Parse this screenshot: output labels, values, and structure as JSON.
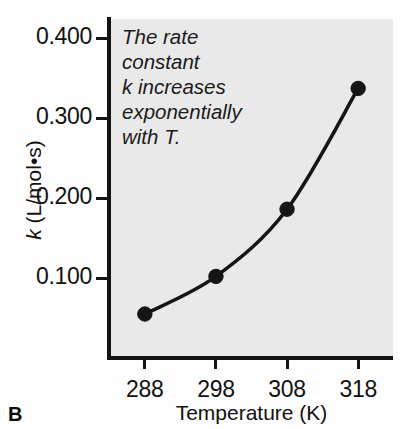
{
  "panel": {
    "label": "B"
  },
  "annotation": {
    "lines": [
      "The rate",
      "constant",
      "k increases",
      "exponentially",
      "with T."
    ],
    "full_text": "The rate constant k increases exponentially with T."
  },
  "axes": {
    "y_title_symbol": "k",
    "y_title_units": " (L/mol•s)",
    "x_title": "Temperature (K)"
  },
  "colors": {
    "plot_background": "#e9e9e9",
    "page_background": "#fdfdfd",
    "ink": "#151515",
    "curve": "#151515",
    "marker": "#151515"
  },
  "chart_data": {
    "type": "line",
    "title": "",
    "subtitle": "",
    "xlabel": "Temperature (K)",
    "ylabel": "k (L/mol•s)",
    "x": [
      288,
      298,
      308,
      318
    ],
    "values": [
      0.055,
      0.102,
      0.186,
      0.337
    ],
    "series": [
      {
        "name": "k",
        "values": [
          0.055,
          0.102,
          0.186,
          0.337
        ]
      }
    ],
    "xtick_labels": [
      "288",
      "298",
      "308",
      "318"
    ],
    "ytick_labels": [
      "0.100",
      "0.200",
      "0.300",
      "0.400"
    ],
    "xticks": [
      288,
      298,
      308,
      318
    ],
    "yticks": [
      0.1,
      0.2,
      0.3,
      0.4
    ],
    "xlim": [
      283.1,
      322.9
    ],
    "ylim": [
      0.0,
      0.4238
    ],
    "grid": false,
    "legend": false,
    "legend_position": "none",
    "markers": "filled-circle",
    "annotations": [
      "The rate constant k increases exponentially with T."
    ],
    "panel_label": "B"
  }
}
